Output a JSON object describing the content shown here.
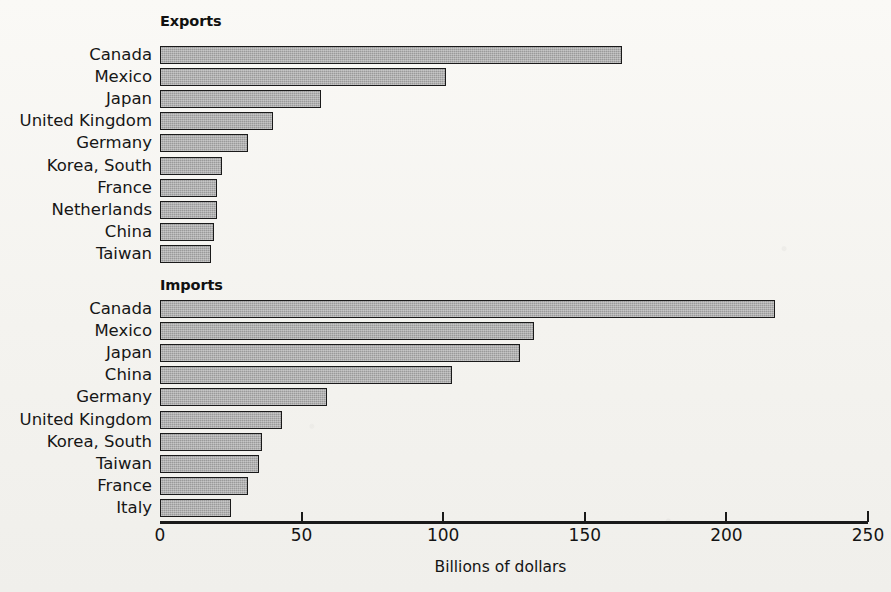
{
  "chart_data": {
    "type": "bar",
    "orientation": "horizontal",
    "title": "",
    "xlabel": "Billions of dollars",
    "ylabel": "",
    "xlim": [
      0,
      250
    ],
    "xticks": [
      0,
      50,
      100,
      150,
      200,
      250
    ],
    "grid": false,
    "legend": "none",
    "panels": [
      {
        "name": "exports",
        "label": "Exports",
        "categories": [
          "Canada",
          "Mexico",
          "Japan",
          "United Kingdom",
          "Germany",
          "Korea, South",
          "France",
          "Netherlands",
          "China",
          "Taiwan"
        ],
        "values": [
          163,
          101,
          57,
          40,
          31,
          22,
          20,
          20,
          19,
          18
        ]
      },
      {
        "name": "imports",
        "label": "Imports",
        "categories": [
          "Canada",
          "Mexico",
          "Japan",
          "China",
          "Germany",
          "United Kingdom",
          "Korea, South",
          "Taiwan",
          "France",
          "Italy"
        ],
        "values": [
          217,
          132,
          127,
          103,
          59,
          43,
          36,
          35,
          31,
          25
        ]
      }
    ]
  },
  "axis": {
    "tick_labels": [
      "0",
      "50",
      "100",
      "150",
      "200",
      "250"
    ],
    "title": "Billions of dollars"
  },
  "colors": {
    "bar_fill": "#9a9a9a",
    "bar_border": "#1a1a1a",
    "text": "#141414",
    "page_background": "#f7f6f3"
  }
}
